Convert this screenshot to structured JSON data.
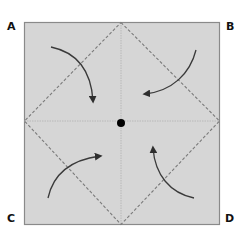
{
  "diagram": {
    "title": "",
    "corner_labels": {
      "a": "A",
      "b": "B",
      "c": "C",
      "d": "D"
    },
    "colors": {
      "paper": "#d6d6d6",
      "border": "#8a8a8a",
      "dashed_line": "#7a7a7a",
      "center_line": "#b8b8b8",
      "arrow": "#3a3a3a",
      "center_dot": "#000000"
    },
    "elements": {
      "square": "paper square with corners A, B, C, D",
      "fold_lines": "dashed diamond connecting edge midpoints",
      "crease_lines": "faint horizontal and vertical center creases",
      "center_point": "black dot at center",
      "arrows": [
        "A-corner fold to center",
        "B-corner fold to center",
        "C-corner fold to center",
        "D-corner fold to center"
      ]
    }
  }
}
